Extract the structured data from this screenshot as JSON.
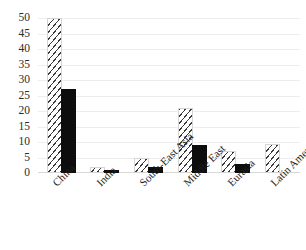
{
  "chart_data": {
    "type": "bar",
    "title": "",
    "subtitle": "",
    "xlabel": "",
    "ylabel": "",
    "ylim": [
      0,
      50
    ],
    "ytick_step": 5,
    "yticks": [
      "50",
      "45",
      "40",
      "35",
      "30",
      "25",
      "20",
      "15",
      "10",
      "5",
      "0"
    ],
    "grid": true,
    "grid_axis": "y",
    "legend": false,
    "legend_position": "none",
    "categories": [
      "China",
      "India",
      "South-East Asia",
      "Middle East",
      "Eurasia",
      "Latin America"
    ],
    "series": [
      {
        "name": "hatched",
        "pattern": "diagonal-hatch",
        "color": "#3a3a3a",
        "fill": "#ffffff",
        "values": [
          50,
          2,
          5,
          21,
          7,
          9.5
        ]
      },
      {
        "name": "solid",
        "pattern": "solid",
        "color": "#0d0d0d",
        "fill": "#0d0d0d",
        "values": [
          27,
          1,
          2,
          9,
          3,
          0
        ]
      }
    ]
  },
  "colors": {
    "background": "#ffffff",
    "gridline": "#ededed",
    "baseline": "#d8d8d8",
    "tick_text": "#2b2b2b",
    "label_text": "#1f1f1f",
    "series_solid": "#0d0d0d",
    "series_hatch": "#3a3a3a"
  }
}
